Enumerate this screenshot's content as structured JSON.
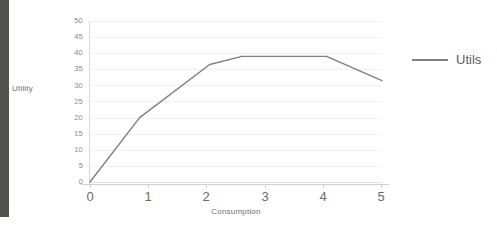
{
  "chart_data": {
    "type": "line",
    "title": "",
    "xlabel": "Consumption",
    "ylabel": "Utility",
    "xlim": [
      0,
      5
    ],
    "ylim": [
      0,
      50
    ],
    "grid": true,
    "legend_position": "right",
    "x_ticks": [
      "0",
      "1",
      "2",
      "3",
      "4",
      "5"
    ],
    "y_ticks": [
      "0",
      "5",
      "10",
      "15",
      "20",
      "25",
      "30",
      "35",
      "40",
      "45",
      "50"
    ],
    "series": [
      {
        "name": "Utils",
        "color": "#7f7f7f",
        "x": [
          0,
          0.85,
          2.05,
          2.6,
          4.05,
          5
        ],
        "values": [
          0,
          20,
          36.5,
          39,
          39,
          31.5
        ]
      }
    ]
  },
  "legend": {
    "entries": [
      {
        "label": "Utils",
        "color": "#7f7f7f"
      }
    ]
  },
  "axes": {
    "y_label": "Utility",
    "x_label": "Consumption",
    "y_tick_labels": [
      "50",
      "45",
      "40",
      "35",
      "30",
      "25",
      "20",
      "15",
      "10",
      "5",
      "0"
    ],
    "x_tick_labels": [
      "0",
      "1",
      "2",
      "3",
      "4",
      "5"
    ]
  },
  "colors": {
    "series_line": "#7f7f7f",
    "gridline": "#f0f0f0",
    "axis": "#d0d0d0",
    "tick_text": "#8a8a8a",
    "label_text": "#6f6f6f",
    "left_strip": "#54524f",
    "background": "#ffffff"
  }
}
